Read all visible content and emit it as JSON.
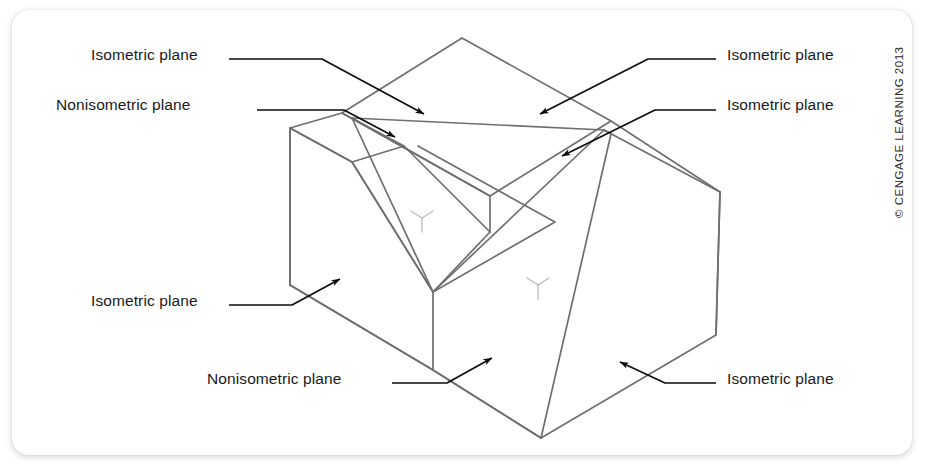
{
  "figure": {
    "type": "isometric-pictorial-drawing",
    "background_color": "#ffffff",
    "card_color": "#ffffff",
    "line_color": "#6b6b6b",
    "leader_color": "#101010",
    "text_color": "#1a1a1a"
  },
  "labels": [
    {
      "id": "top-left-isometric",
      "text": "Isometric plane",
      "x": 91,
      "y": 54,
      "align": "left"
    },
    {
      "id": "left-nonisometric",
      "text": "Nonisometric plane",
      "x": 56,
      "y": 104,
      "align": "left"
    },
    {
      "id": "top-right-isometric",
      "text": "Isometric plane",
      "x": 727,
      "y": 54,
      "align": "left"
    },
    {
      "id": "right-upper-isometric",
      "text": "Isometric plane",
      "x": 727,
      "y": 104,
      "align": "left"
    },
    {
      "id": "lower-left-isometric",
      "text": "Isometric plane",
      "x": 91,
      "y": 300,
      "align": "left"
    },
    {
      "id": "bottom-nonisometric",
      "text": "Nonisometric plane",
      "x": 207,
      "y": 378,
      "align": "left"
    },
    {
      "id": "bottom-right-isometric",
      "text": "Isometric plane",
      "x": 727,
      "y": 378,
      "align": "left"
    }
  ],
  "copyright": {
    "text": "© CENGAGE LEARNING 2013"
  },
  "axis_markers": [
    {
      "id": "axis-marker-left",
      "x": 422,
      "y": 218
    },
    {
      "id": "axis-marker-right",
      "x": 538,
      "y": 285
    }
  ],
  "leaders": [
    {
      "id": "leader-top-left-isometric",
      "polyline": "229,59 322,59 424,114",
      "arrow_at": "424,114",
      "arrow_angle": 28
    },
    {
      "id": "leader-left-nonisometric",
      "polyline": "257,110 344,110 395,137",
      "arrow_at": "395,137",
      "arrow_angle": 28
    },
    {
      "id": "leader-top-right-isometric",
      "polyline": "716,59 648,59 540,114",
      "arrow_at": "540,114",
      "arrow_angle": 207
    },
    {
      "id": "leader-right-upper-isometric",
      "polyline": "716,110 655,110 562,156",
      "arrow_at": "562,156",
      "arrow_angle": 207
    },
    {
      "id": "leader-lower-left-isometric",
      "polyline": "229,305 292,305 340,279",
      "arrow_at": "340,279",
      "arrow_angle": -28
    },
    {
      "id": "leader-bottom-nonisometric",
      "polyline": "392,383 447,383 492,358",
      "arrow_at": "492,358",
      "arrow_angle": -28
    },
    {
      "id": "leader-bottom-right-isometric",
      "polyline": "716,383 665,383 620,362",
      "arrow_at": "620,362",
      "arrow_angle": 205
    }
  ],
  "geometry": {
    "description": "Isometric block: large rectangular prism with a V-shaped groove cut diagonally across the top and a large inclined nonisometric plane on the right front.",
    "vertices": {
      "top_apex": [
        462,
        38
      ],
      "top_left": [
        342,
        113
      ],
      "top_right": [
        611,
        121
      ],
      "top_front": [
        490,
        196
      ],
      "left_back_top": [
        290,
        128
      ],
      "left_front_bottom": [
        288,
        285
      ],
      "groove_left_top": [
        352,
        118
      ],
      "groove_inner_bottom": [
        433,
        292
      ],
      "groove_right_top": [
        604,
        130
      ],
      "right_corner": [
        720,
        192
      ],
      "right_lower_corner": [
        716,
        335
      ],
      "bottom_center": [
        433,
        370
      ],
      "bottom_apex": [
        541,
        438
      ]
    }
  }
}
